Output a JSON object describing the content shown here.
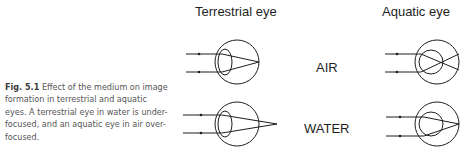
{
  "figure": {
    "caption": {
      "label": "Fig. 5.1",
      "text": "Effect of the medium on image formation in terrestrial and aquatic eyes. A terrestrial eye in water is under-focused, and an aquatic eye in air over-focused."
    },
    "columns": [
      {
        "heading": "Terrestrial eye"
      },
      {
        "heading": "Aquatic eye"
      }
    ],
    "rows": [
      {
        "medium": "AIR"
      },
      {
        "medium": "WATER"
      }
    ],
    "colors": {
      "line": "#1e1e1e",
      "caption_text": "#555555",
      "background": "#ffffff"
    }
  }
}
